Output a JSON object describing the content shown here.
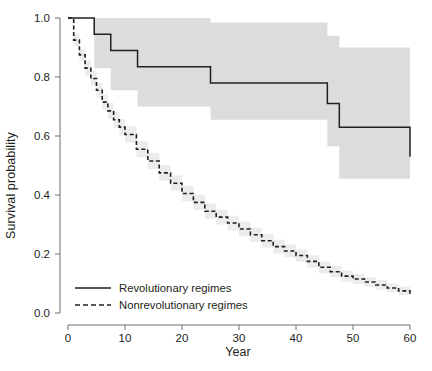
{
  "chart_data": {
    "type": "line",
    "title": "",
    "xlabel": "Year",
    "ylabel": "Survival probability",
    "xlim": [
      0,
      60
    ],
    "ylim": [
      0.0,
      1.0
    ],
    "xticks": [
      0,
      10,
      20,
      30,
      40,
      50,
      60
    ],
    "xticklabels": [
      "0",
      "10",
      "20",
      "30",
      "40",
      "50",
      "60"
    ],
    "yticks": [
      0.0,
      0.2,
      0.4,
      0.6,
      0.8,
      1.0
    ],
    "yticklabels": [
      "0.0",
      "0.2",
      "0.4",
      "0.6",
      "0.8",
      "1.0"
    ],
    "grid": false,
    "legend_position": "bottom-left",
    "band_color": "#dcdcdc",
    "line_color": "#231f20",
    "series": [
      {
        "name": "Revolutionary regimes",
        "style": "solid",
        "step": "post",
        "x": [
          0,
          4.0,
          4.6,
          7.5,
          11.4,
          12.2,
          25.0,
          45.5,
          47.6,
          60
        ],
        "values": [
          1.0,
          1.0,
          0.945,
          0.89,
          0.89,
          0.835,
          0.78,
          0.71,
          0.63,
          0.53
        ],
        "band_upper": [
          1.0,
          1.0,
          1.0,
          1.0,
          1.0,
          1.0,
          0.985,
          0.94,
          0.9,
          0.86
        ],
        "band_lower": [
          1.0,
          1.0,
          0.83,
          0.755,
          0.755,
          0.7,
          0.655,
          0.565,
          0.455,
          0.4
        ]
      },
      {
        "name": "Nonrevolutionary regimes",
        "style": "dashed",
        "step": "post",
        "x": [
          0,
          1,
          2,
          3,
          4,
          5,
          6,
          7,
          8,
          9,
          10,
          12,
          14,
          16,
          18,
          20,
          22,
          24,
          26,
          28,
          30,
          32,
          34,
          36,
          38,
          40,
          42,
          44,
          46,
          48,
          50,
          52,
          54,
          56,
          58,
          60
        ],
        "values": [
          1.0,
          0.925,
          0.875,
          0.83,
          0.795,
          0.755,
          0.715,
          0.685,
          0.655,
          0.63,
          0.605,
          0.555,
          0.515,
          0.475,
          0.44,
          0.405,
          0.375,
          0.345,
          0.325,
          0.305,
          0.285,
          0.265,
          0.245,
          0.225,
          0.21,
          0.195,
          0.175,
          0.155,
          0.14,
          0.125,
          0.115,
          0.105,
          0.095,
          0.085,
          0.075,
          0.065
        ],
        "band_upper": [
          1.0,
          0.945,
          0.895,
          0.855,
          0.82,
          0.78,
          0.74,
          0.712,
          0.682,
          0.658,
          0.632,
          0.582,
          0.542,
          0.502,
          0.466,
          0.431,
          0.401,
          0.371,
          0.35,
          0.33,
          0.31,
          0.289,
          0.268,
          0.248,
          0.232,
          0.216,
          0.196,
          0.175,
          0.159,
          0.143,
          0.132,
          0.121,
          0.111,
          0.1,
          0.089,
          0.079
        ],
        "band_lower": [
          1.0,
          0.905,
          0.855,
          0.805,
          0.77,
          0.73,
          0.69,
          0.658,
          0.628,
          0.602,
          0.578,
          0.528,
          0.488,
          0.448,
          0.414,
          0.379,
          0.349,
          0.319,
          0.3,
          0.28,
          0.26,
          0.241,
          0.222,
          0.202,
          0.188,
          0.174,
          0.154,
          0.135,
          0.121,
          0.107,
          0.098,
          0.089,
          0.079,
          0.07,
          0.061,
          0.051
        ]
      }
    ]
  },
  "axes": {
    "ylabel": "Survival probability",
    "xlabel": "Year"
  },
  "legend": {
    "items": [
      {
        "label": "Revolutionary regimes",
        "style": "solid"
      },
      {
        "label": "Nonrevolutionary regimes",
        "style": "dashed"
      }
    ]
  }
}
